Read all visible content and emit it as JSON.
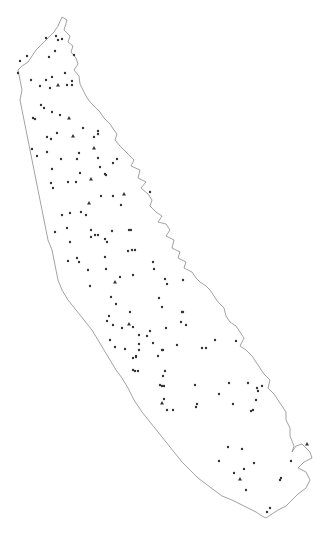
{
  "map": {
    "background": "#ffffff",
    "outline_color": "#8a8a8a",
    "point_color": "#333333",
    "outline": [
      [
        62,
        17
      ],
      [
        67,
        20
      ],
      [
        64,
        30
      ],
      [
        70,
        36
      ],
      [
        68,
        42
      ],
      [
        73,
        46
      ],
      [
        71,
        52
      ],
      [
        76,
        58
      ],
      [
        78,
        64
      ],
      [
        74,
        70
      ],
      [
        79,
        76
      ],
      [
        80,
        84
      ],
      [
        83,
        90
      ],
      [
        86,
        96
      ],
      [
        90,
        102
      ],
      [
        96,
        108
      ],
      [
        100,
        112
      ],
      [
        104,
        118
      ],
      [
        110,
        124
      ],
      [
        114,
        130
      ],
      [
        117,
        134
      ],
      [
        115,
        140
      ],
      [
        120,
        146
      ],
      [
        124,
        150
      ],
      [
        130,
        156
      ],
      [
        134,
        160
      ],
      [
        131,
        166
      ],
      [
        140,
        170
      ],
      [
        138,
        178
      ],
      [
        146,
        182
      ],
      [
        141,
        188
      ],
      [
        148,
        194
      ],
      [
        152,
        200
      ],
      [
        150,
        206
      ],
      [
        156,
        212
      ],
      [
        162,
        216
      ],
      [
        158,
        222
      ],
      [
        166,
        224
      ],
      [
        170,
        230
      ],
      [
        166,
        236
      ],
      [
        174,
        240
      ],
      [
        172,
        248
      ],
      [
        180,
        252
      ],
      [
        178,
        258
      ],
      [
        186,
        262
      ],
      [
        184,
        268
      ],
      [
        192,
        272
      ],
      [
        196,
        278
      ],
      [
        200,
        282
      ],
      [
        206,
        286
      ],
      [
        210,
        290
      ],
      [
        214,
        296
      ],
      [
        218,
        302
      ],
      [
        224,
        308
      ],
      [
        226,
        316
      ],
      [
        230,
        322
      ],
      [
        236,
        326
      ],
      [
        240,
        332
      ],
      [
        244,
        338
      ],
      [
        240,
        346
      ],
      [
        246,
        350
      ],
      [
        252,
        356
      ],
      [
        256,
        362
      ],
      [
        260,
        368
      ],
      [
        264,
        374
      ],
      [
        270,
        380
      ],
      [
        268,
        388
      ],
      [
        274,
        394
      ],
      [
        278,
        400
      ],
      [
        282,
        406
      ],
      [
        286,
        412
      ],
      [
        286,
        420
      ],
      [
        290,
        428
      ],
      [
        290,
        436
      ],
      [
        294,
        446
      ],
      [
        292,
        452
      ],
      [
        296,
        446
      ],
      [
        302,
        444
      ],
      [
        306,
        448
      ],
      [
        310,
        452
      ],
      [
        312,
        458
      ],
      [
        304,
        462
      ],
      [
        298,
        468
      ],
      [
        306,
        472
      ],
      [
        310,
        480
      ],
      [
        306,
        488
      ],
      [
        298,
        494
      ],
      [
        292,
        500
      ],
      [
        286,
        506
      ],
      [
        278,
        510
      ],
      [
        272,
        514
      ],
      [
        266,
        518
      ],
      [
        262,
        516
      ],
      [
        256,
        512
      ],
      [
        248,
        508
      ],
      [
        240,
        504
      ],
      [
        232,
        500
      ],
      [
        222,
        496
      ],
      [
        214,
        490
      ],
      [
        206,
        484
      ],
      [
        198,
        478
      ],
      [
        190,
        470
      ],
      [
        182,
        462
      ],
      [
        174,
        452
      ],
      [
        166,
        442
      ],
      [
        158,
        432
      ],
      [
        150,
        422
      ],
      [
        142,
        412
      ],
      [
        134,
        400
      ],
      [
        128,
        388
      ],
      [
        122,
        378
      ],
      [
        116,
        370
      ],
      [
        110,
        360
      ],
      [
        104,
        350
      ],
      [
        98,
        340
      ],
      [
        92,
        330
      ],
      [
        84,
        320
      ],
      [
        76,
        310
      ],
      [
        68,
        300
      ],
      [
        62,
        290
      ],
      [
        58,
        280
      ],
      [
        56,
        270
      ],
      [
        54,
        260
      ],
      [
        52,
        250
      ],
      [
        48,
        240
      ],
      [
        46,
        230
      ],
      [
        44,
        220
      ],
      [
        42,
        210
      ],
      [
        40,
        200
      ],
      [
        38,
        190
      ],
      [
        36,
        180
      ],
      [
        34,
        170
      ],
      [
        32,
        160
      ],
      [
        30,
        150
      ],
      [
        28,
        140
      ],
      [
        26,
        130
      ],
      [
        24,
        120
      ],
      [
        22,
        110
      ],
      [
        20,
        100
      ],
      [
        22,
        90
      ],
      [
        20,
        80
      ],
      [
        18,
        70
      ],
      [
        22,
        66
      ],
      [
        28,
        62
      ],
      [
        32,
        56
      ],
      [
        36,
        50
      ],
      [
        42,
        44
      ],
      [
        48,
        38
      ],
      [
        54,
        32
      ],
      [
        58,
        26
      ],
      [
        62,
        17
      ]
    ],
    "points": [
      {
        "x": 56,
        "y": 36,
        "shape": "circle"
      },
      {
        "x": 58,
        "y": 40,
        "shape": "circle"
      },
      {
        "x": 62,
        "y": 39,
        "shape": "circle"
      },
      {
        "x": 46,
        "y": 38,
        "shape": "circle"
      },
      {
        "x": 55,
        "y": 51,
        "shape": "circle"
      },
      {
        "x": 49,
        "y": 57,
        "shape": "circle"
      },
      {
        "x": 74,
        "y": 55,
        "shape": "circle"
      },
      {
        "x": 20,
        "y": 61,
        "shape": "circle"
      },
      {
        "x": 27,
        "y": 56,
        "shape": "circle"
      },
      {
        "x": 18,
        "y": 73,
        "shape": "circle"
      },
      {
        "x": 31,
        "y": 80,
        "shape": "circle"
      },
      {
        "x": 46,
        "y": 80,
        "shape": "circle"
      },
      {
        "x": 52,
        "y": 77,
        "shape": "circle"
      },
      {
        "x": 40,
        "y": 86,
        "shape": "circle"
      },
      {
        "x": 50,
        "y": 88,
        "shape": "circle"
      },
      {
        "x": 58,
        "y": 85,
        "shape": "triangle"
      },
      {
        "x": 67,
        "y": 85,
        "shape": "circle"
      },
      {
        "x": 72,
        "y": 81,
        "shape": "circle"
      },
      {
        "x": 72,
        "y": 85,
        "shape": "circle"
      },
      {
        "x": 65,
        "y": 73,
        "shape": "circle"
      },
      {
        "x": 41,
        "y": 105,
        "shape": "circle"
      },
      {
        "x": 44,
        "y": 108,
        "shape": "circle"
      },
      {
        "x": 52,
        "y": 112,
        "shape": "circle"
      },
      {
        "x": 60,
        "y": 115,
        "shape": "circle"
      },
      {
        "x": 69,
        "y": 118,
        "shape": "triangle"
      },
      {
        "x": 33,
        "y": 118,
        "shape": "circle"
      },
      {
        "x": 35,
        "y": 119,
        "shape": "circle"
      },
      {
        "x": 83,
        "y": 128,
        "shape": "circle"
      },
      {
        "x": 57,
        "y": 133,
        "shape": "circle"
      },
      {
        "x": 73,
        "y": 136,
        "shape": "triangle"
      },
      {
        "x": 47,
        "y": 137,
        "shape": "circle"
      },
      {
        "x": 51,
        "y": 139,
        "shape": "circle"
      },
      {
        "x": 94,
        "y": 137,
        "shape": "circle"
      },
      {
        "x": 98,
        "y": 131,
        "shape": "circle"
      },
      {
        "x": 98,
        "y": 134,
        "shape": "circle"
      },
      {
        "x": 32,
        "y": 149,
        "shape": "circle"
      },
      {
        "x": 37,
        "y": 156,
        "shape": "circle"
      },
      {
        "x": 47,
        "y": 152,
        "shape": "circle"
      },
      {
        "x": 61,
        "y": 159,
        "shape": "circle"
      },
      {
        "x": 79,
        "y": 153,
        "shape": "circle"
      },
      {
        "x": 77,
        "y": 159,
        "shape": "circle"
      },
      {
        "x": 94,
        "y": 148,
        "shape": "triangle"
      },
      {
        "x": 98,
        "y": 158,
        "shape": "circle"
      },
      {
        "x": 100,
        "y": 167,
        "shape": "circle"
      },
      {
        "x": 105,
        "y": 174,
        "shape": "circle"
      },
      {
        "x": 106,
        "y": 175,
        "shape": "circle"
      },
      {
        "x": 91,
        "y": 179,
        "shape": "triangle"
      },
      {
        "x": 117,
        "y": 159,
        "shape": "circle"
      },
      {
        "x": 113,
        "y": 163,
        "shape": "circle"
      },
      {
        "x": 52,
        "y": 169,
        "shape": "circle"
      },
      {
        "x": 80,
        "y": 173,
        "shape": "circle"
      },
      {
        "x": 68,
        "y": 182,
        "shape": "circle"
      },
      {
        "x": 76,
        "y": 182,
        "shape": "circle"
      },
      {
        "x": 51,
        "y": 183,
        "shape": "circle"
      },
      {
        "x": 53,
        "y": 188,
        "shape": "circle"
      },
      {
        "x": 101,
        "y": 196,
        "shape": "circle"
      },
      {
        "x": 113,
        "y": 196,
        "shape": "circle"
      },
      {
        "x": 124,
        "y": 194,
        "shape": "triangle"
      },
      {
        "x": 89,
        "y": 203,
        "shape": "triangle"
      },
      {
        "x": 121,
        "y": 205,
        "shape": "circle"
      },
      {
        "x": 150,
        "y": 192,
        "shape": "circle"
      },
      {
        "x": 62,
        "y": 215,
        "shape": "circle"
      },
      {
        "x": 70,
        "y": 213,
        "shape": "circle"
      },
      {
        "x": 81,
        "y": 212,
        "shape": "circle"
      },
      {
        "x": 86,
        "y": 215,
        "shape": "circle"
      },
      {
        "x": 67,
        "y": 228,
        "shape": "circle"
      },
      {
        "x": 91,
        "y": 230,
        "shape": "circle"
      },
      {
        "x": 91,
        "y": 237,
        "shape": "circle"
      },
      {
        "x": 95,
        "y": 235,
        "shape": "circle"
      },
      {
        "x": 98,
        "y": 235,
        "shape": "circle"
      },
      {
        "x": 105,
        "y": 239,
        "shape": "circle"
      },
      {
        "x": 107,
        "y": 242,
        "shape": "circle"
      },
      {
        "x": 112,
        "y": 231,
        "shape": "circle"
      },
      {
        "x": 129,
        "y": 230,
        "shape": "circle"
      },
      {
        "x": 131,
        "y": 230,
        "shape": "circle"
      },
      {
        "x": 55,
        "y": 232,
        "shape": "circle"
      },
      {
        "x": 70,
        "y": 242,
        "shape": "circle"
      },
      {
        "x": 128,
        "y": 251,
        "shape": "circle"
      },
      {
        "x": 132,
        "y": 250,
        "shape": "circle"
      },
      {
        "x": 135,
        "y": 250,
        "shape": "circle"
      },
      {
        "x": 68,
        "y": 261,
        "shape": "circle"
      },
      {
        "x": 77,
        "y": 258,
        "shape": "circle"
      },
      {
        "x": 79,
        "y": 262,
        "shape": "circle"
      },
      {
        "x": 105,
        "y": 257,
        "shape": "circle"
      },
      {
        "x": 153,
        "y": 262,
        "shape": "circle"
      },
      {
        "x": 88,
        "y": 270,
        "shape": "circle"
      },
      {
        "x": 106,
        "y": 269,
        "shape": "circle"
      },
      {
        "x": 154,
        "y": 269,
        "shape": "circle"
      },
      {
        "x": 120,
        "y": 277,
        "shape": "circle"
      },
      {
        "x": 115,
        "y": 282,
        "shape": "triangle"
      },
      {
        "x": 133,
        "y": 275,
        "shape": "circle"
      },
      {
        "x": 165,
        "y": 279,
        "shape": "circle"
      },
      {
        "x": 167,
        "y": 284,
        "shape": "circle"
      },
      {
        "x": 183,
        "y": 280,
        "shape": "circle"
      },
      {
        "x": 90,
        "y": 286,
        "shape": "circle"
      },
      {
        "x": 111,
        "y": 297,
        "shape": "circle"
      },
      {
        "x": 116,
        "y": 304,
        "shape": "circle"
      },
      {
        "x": 130,
        "y": 312,
        "shape": "circle"
      },
      {
        "x": 159,
        "y": 298,
        "shape": "circle"
      },
      {
        "x": 162,
        "y": 307,
        "shape": "circle"
      },
      {
        "x": 182,
        "y": 312,
        "shape": "circle"
      },
      {
        "x": 183,
        "y": 312,
        "shape": "circle"
      },
      {
        "x": 181,
        "y": 322,
        "shape": "circle"
      },
      {
        "x": 186,
        "y": 325,
        "shape": "circle"
      },
      {
        "x": 109,
        "y": 316,
        "shape": "circle"
      },
      {
        "x": 122,
        "y": 328,
        "shape": "circle"
      },
      {
        "x": 107,
        "y": 321,
        "shape": "circle"
      },
      {
        "x": 129,
        "y": 324,
        "shape": "triangle"
      },
      {
        "x": 113,
        "y": 325,
        "shape": "circle"
      },
      {
        "x": 133,
        "y": 327,
        "shape": "circle"
      },
      {
        "x": 110,
        "y": 340,
        "shape": "circle"
      },
      {
        "x": 150,
        "y": 331,
        "shape": "circle"
      },
      {
        "x": 147,
        "y": 336,
        "shape": "circle"
      },
      {
        "x": 139,
        "y": 335,
        "shape": "circle"
      },
      {
        "x": 166,
        "y": 328,
        "shape": "circle"
      },
      {
        "x": 115,
        "y": 347,
        "shape": "circle"
      },
      {
        "x": 125,
        "y": 349,
        "shape": "circle"
      },
      {
        "x": 139,
        "y": 344,
        "shape": "circle"
      },
      {
        "x": 153,
        "y": 343,
        "shape": "circle"
      },
      {
        "x": 158,
        "y": 356,
        "shape": "circle"
      },
      {
        "x": 162,
        "y": 350,
        "shape": "circle"
      },
      {
        "x": 177,
        "y": 345,
        "shape": "circle"
      },
      {
        "x": 202,
        "y": 348,
        "shape": "circle"
      },
      {
        "x": 206,
        "y": 348,
        "shape": "circle"
      },
      {
        "x": 215,
        "y": 340,
        "shape": "circle"
      },
      {
        "x": 139,
        "y": 350,
        "shape": "circle"
      },
      {
        "x": 163,
        "y": 350,
        "shape": "circle"
      },
      {
        "x": 236,
        "y": 341,
        "shape": "circle"
      },
      {
        "x": 165,
        "y": 371,
        "shape": "circle"
      },
      {
        "x": 163,
        "y": 376,
        "shape": "circle"
      },
      {
        "x": 136,
        "y": 356,
        "shape": "circle"
      },
      {
        "x": 133,
        "y": 358,
        "shape": "circle"
      },
      {
        "x": 136,
        "y": 357,
        "shape": "circle"
      },
      {
        "x": 133,
        "y": 370,
        "shape": "circle"
      },
      {
        "x": 135,
        "y": 371,
        "shape": "circle"
      },
      {
        "x": 138,
        "y": 371,
        "shape": "circle"
      },
      {
        "x": 160,
        "y": 385,
        "shape": "circle"
      },
      {
        "x": 162,
        "y": 386,
        "shape": "circle"
      },
      {
        "x": 164,
        "y": 386,
        "shape": "circle"
      },
      {
        "x": 195,
        "y": 385,
        "shape": "circle"
      },
      {
        "x": 219,
        "y": 394,
        "shape": "circle"
      },
      {
        "x": 229,
        "y": 383,
        "shape": "circle"
      },
      {
        "x": 248,
        "y": 383,
        "shape": "circle"
      },
      {
        "x": 257,
        "y": 388,
        "shape": "circle"
      },
      {
        "x": 258,
        "y": 391,
        "shape": "circle"
      },
      {
        "x": 262,
        "y": 386,
        "shape": "circle"
      },
      {
        "x": 164,
        "y": 399,
        "shape": "circle"
      },
      {
        "x": 162,
        "y": 403,
        "shape": "triangle"
      },
      {
        "x": 173,
        "y": 410,
        "shape": "circle"
      },
      {
        "x": 196,
        "y": 407,
        "shape": "circle"
      },
      {
        "x": 256,
        "y": 400,
        "shape": "circle"
      },
      {
        "x": 253,
        "y": 410,
        "shape": "circle"
      },
      {
        "x": 167,
        "y": 410,
        "shape": "circle"
      },
      {
        "x": 197,
        "y": 404,
        "shape": "circle"
      },
      {
        "x": 233,
        "y": 404,
        "shape": "circle"
      },
      {
        "x": 251,
        "y": 411,
        "shape": "circle"
      },
      {
        "x": 228,
        "y": 447,
        "shape": "circle"
      },
      {
        "x": 242,
        "y": 449,
        "shape": "circle"
      },
      {
        "x": 219,
        "y": 461,
        "shape": "circle"
      },
      {
        "x": 234,
        "y": 473,
        "shape": "circle"
      },
      {
        "x": 244,
        "y": 469,
        "shape": "circle"
      },
      {
        "x": 254,
        "y": 463,
        "shape": "circle"
      },
      {
        "x": 240,
        "y": 479,
        "shape": "triangle"
      },
      {
        "x": 246,
        "y": 490,
        "shape": "circle"
      },
      {
        "x": 281,
        "y": 478,
        "shape": "circle"
      },
      {
        "x": 280,
        "y": 480,
        "shape": "circle"
      },
      {
        "x": 291,
        "y": 461,
        "shape": "circle"
      },
      {
        "x": 307,
        "y": 444,
        "shape": "triangle"
      },
      {
        "x": 270,
        "y": 508,
        "shape": "circle"
      },
      {
        "x": 267,
        "y": 512,
        "shape": "circle"
      }
    ]
  }
}
